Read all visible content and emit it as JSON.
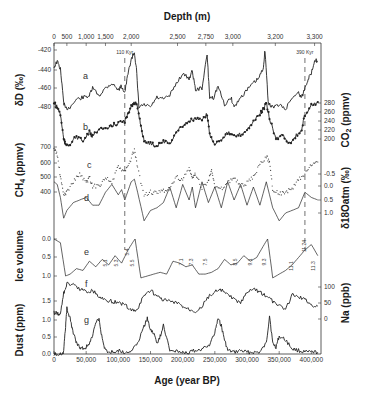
{
  "chart_data": {
    "type": "line",
    "title": "",
    "xlabel": "Age (year BP)",
    "x_top_label": "Depth (m)",
    "xlim": [
      0,
      415000
    ],
    "x_ticks": [
      0,
      50000,
      100000,
      150000,
      200000,
      250000,
      300000,
      350000,
      400000
    ],
    "x_tick_labels": [
      "0",
      "50,000",
      "100,000",
      "150,000",
      "200,000",
      "250,000",
      "300,000",
      "350,000",
      "400,000"
    ],
    "top_ticks": [
      {
        "label": "0",
        "age": 0
      },
      {
        "label": "500",
        "age": 20000
      },
      {
        "label": "1,000",
        "age": 50000
      },
      {
        "label": "1,500",
        "age": 80000
      },
      {
        "label": "2,000",
        "age": 120000
      },
      {
        "label": "2,500",
        "age": 192000
      },
      {
        "label": "2,750",
        "age": 236000
      },
      {
        "label": "3,000",
        "age": 278000
      },
      {
        "label": "3,200",
        "age": 344000
      },
      {
        "label": "3,300",
        "age": 405000
      }
    ],
    "markers": [
      {
        "label": "110 Kyr",
        "age": 110000
      },
      {
        "label": "390 Kyr",
        "age": 390000
      }
    ],
    "panels": [
      {
        "id": "a",
        "name": "δD",
        "axis_label": "δD (‰)",
        "side": "left",
        "ticks": [
          -420,
          -440,
          -460,
          -480
        ],
        "tick_px": [
          50,
          70,
          88,
          107
        ],
        "style": "line"
      },
      {
        "id": "b",
        "name": "CO2",
        "axis_label": "CO2 (ppmv)",
        "side": "right",
        "ticks": [
          280,
          260,
          240,
          220,
          200
        ],
        "tick_px": [
          103,
          112,
          121,
          130,
          139
        ],
        "style": "line-markers"
      },
      {
        "id": "c",
        "name": "CH4",
        "axis_label": "CH4 (ppmv)",
        "side": "left",
        "ticks": [
          700,
          600,
          500,
          400
        ],
        "tick_px": [
          147,
          163,
          177,
          192
        ],
        "style": "dotted"
      },
      {
        "id": "d",
        "name": "δ18Oatm",
        "axis_label": "δ18Oatm (‰)",
        "side": "right",
        "ticks": [
          -0.5,
          0.0,
          0.5,
          1.0
        ],
        "tick_px": [
          174,
          186,
          200,
          213
        ],
        "style": "line"
      },
      {
        "id": "e",
        "name": "Ice volume",
        "axis_label": "Ice volume",
        "side": "left",
        "ticks": [
          0.0,
          0.5,
          1.0
        ],
        "tick_px": [
          239,
          257,
          276
        ],
        "style": "line"
      },
      {
        "id": "f",
        "name": "Na",
        "axis_label": "Na (ppb)",
        "side": "right",
        "ticks": [
          100,
          50,
          0
        ],
        "tick_px": [
          287,
          303,
          319
        ],
        "style": "line"
      },
      {
        "id": "g",
        "name": "Dust",
        "axis_label": "Dust (ppm)",
        "side": "left",
        "ticks": [
          1.5,
          1.0,
          0.5,
          0.0
        ],
        "tick_px": [
          301,
          320,
          337,
          354
        ],
        "style": "line"
      }
    ],
    "mis_labels": [
      "5.1",
      "5.3",
      "5.4",
      "5.5",
      "7.1",
      "7.3",
      "7.5",
      "8.5",
      "9.1",
      "9.3",
      "11.1",
      "11.24",
      "11.3"
    ],
    "series": [
      {
        "name": "δD (a)",
        "x": [
          0,
          5000,
          10000,
          15000,
          18000,
          25000,
          35000,
          45000,
          55000,
          60000,
          70000,
          80000,
          90000,
          100000,
          105000,
          110000,
          115000,
          120000,
          125000,
          128000,
          132000,
          140000,
          150000,
          160000,
          170000,
          180000,
          190000,
          200000,
          210000,
          215000,
          220000,
          230000,
          238000,
          242000,
          248000,
          255000,
          265000,
          275000,
          280000,
          290000,
          300000,
          310000,
          318000,
          325000,
          328000,
          333000,
          340000,
          350000,
          360000,
          370000,
          380000,
          385000,
          390000,
          395000,
          400000,
          405000,
          410000
        ],
        "y": [
          -438,
          -432,
          -440,
          -475,
          -482,
          -480,
          -472,
          -470,
          -468,
          -460,
          -468,
          -460,
          -455,
          -462,
          -458,
          -465,
          -445,
          -430,
          -422,
          -440,
          -480,
          -478,
          -480,
          -470,
          -472,
          -468,
          -455,
          -445,
          -450,
          -442,
          -462,
          -460,
          -425,
          -470,
          -470,
          -458,
          -478,
          -470,
          -480,
          -470,
          -462,
          -455,
          -450,
          -440,
          -420,
          -476,
          -480,
          -478,
          -482,
          -470,
          -465,
          -470,
          -460,
          -450,
          -445,
          -430,
          -432
        ]
      },
      {
        "name": "CO2 (b)",
        "x": [
          0,
          5000,
          10000,
          15000,
          18000,
          25000,
          35000,
          45000,
          55000,
          60000,
          70000,
          80000,
          90000,
          100000,
          110000,
          115000,
          120000,
          125000,
          130000,
          135000,
          140000,
          150000,
          160000,
          170000,
          180000,
          190000,
          200000,
          210000,
          220000,
          230000,
          238000,
          242000,
          250000,
          260000,
          270000,
          280000,
          290000,
          300000,
          310000,
          320000,
          325000,
          330000,
          335000,
          345000,
          355000,
          365000,
          375000,
          385000,
          390000,
          400000,
          410000
        ],
        "y": [
          280,
          270,
          255,
          200,
          185,
          190,
          205,
          195,
          215,
          205,
          225,
          220,
          230,
          235,
          240,
          255,
          275,
          280,
          270,
          230,
          195,
          190,
          185,
          195,
          190,
          215,
          230,
          240,
          245,
          240,
          255,
          210,
          190,
          200,
          215,
          205,
          210,
          220,
          240,
          255,
          265,
          280,
          245,
          200,
          210,
          190,
          205,
          220,
          255,
          275,
          282
        ]
      },
      {
        "name": "CH4 (c)",
        "x": [
          0,
          5000,
          10000,
          15000,
          20000,
          30000,
          40000,
          50000,
          55000,
          60000,
          70000,
          80000,
          90000,
          100000,
          110000,
          118000,
          125000,
          130000,
          140000,
          150000,
          160000,
          170000,
          180000,
          190000,
          200000,
          210000,
          215000,
          220000,
          230000,
          240000,
          245000,
          250000,
          260000,
          270000,
          280000,
          290000,
          300000,
          310000,
          320000,
          330000,
          335000,
          340000,
          350000,
          360000,
          370000,
          380000,
          390000,
          400000,
          410000
        ],
        "y": [
          690,
          650,
          500,
          380,
          400,
          470,
          520,
          460,
          500,
          440,
          440,
          500,
          460,
          570,
          530,
          600,
          680,
          560,
          380,
          400,
          390,
          410,
          420,
          500,
          480,
          560,
          490,
          520,
          430,
          470,
          560,
          430,
          420,
          460,
          500,
          440,
          460,
          500,
          580,
          640,
          600,
          420,
          390,
          400,
          420,
          480,
          520,
          580,
          600
        ]
      },
      {
        "name": "δ18Oatm (d)",
        "x": [
          0,
          5000,
          10000,
          15000,
          20000,
          30000,
          40000,
          50000,
          60000,
          70000,
          80000,
          90000,
          100000,
          105000,
          110000,
          120000,
          125000,
          130000,
          140000,
          150000,
          160000,
          170000,
          180000,
          190000,
          200000,
          210000,
          215000,
          220000,
          230000,
          240000,
          250000,
          260000,
          270000,
          280000,
          290000,
          300000,
          310000,
          320000,
          330000,
          340000,
          350000,
          360000,
          370000,
          380000,
          390000,
          400000,
          410000
        ],
        "y": [
          -0.2,
          -0.1,
          0.4,
          1.2,
          0.9,
          0.6,
          0.5,
          0.4,
          0.7,
          0.7,
          0.2,
          -0.1,
          0.3,
          0.1,
          0.5,
          -0.2,
          -0.3,
          0.2,
          1.3,
          0.9,
          0.8,
          0.6,
          0.0,
          0.8,
          -0.1,
          0.5,
          0.0,
          0.8,
          -0.2,
          0.6,
          0.0,
          0.8,
          -0.2,
          0.5,
          -0.1,
          0.7,
          0.0,
          0.7,
          -0.2,
          0.8,
          1.3,
          1.0,
          0.9,
          0.8,
          0.2,
          0.4,
          0.5
        ]
      },
      {
        "name": "Ice volume (e)",
        "x": [
          0,
          10000,
          18000,
          25000,
          35000,
          45000,
          55000,
          65000,
          75000,
          85000,
          95000,
          105000,
          115000,
          122000,
          126000,
          135000,
          145000,
          155000,
          165000,
          175000,
          185000,
          195000,
          205000,
          215000,
          225000,
          235000,
          245000,
          255000,
          265000,
          275000,
          285000,
          295000,
          305000,
          315000,
          325000,
          332000,
          340000,
          350000,
          360000,
          370000,
          380000,
          390000,
          400000,
          410000
        ],
        "y": [
          0.0,
          0.1,
          1.0,
          0.95,
          0.8,
          0.85,
          0.6,
          0.75,
          0.55,
          0.7,
          0.45,
          0.65,
          0.3,
          0.1,
          0.0,
          1.05,
          1.0,
          0.95,
          0.9,
          0.95,
          0.6,
          0.65,
          0.75,
          0.7,
          0.95,
          0.95,
          0.9,
          0.8,
          0.55,
          0.7,
          0.65,
          0.45,
          0.6,
          0.5,
          0.2,
          0.0,
          1.05,
          0.95,
          0.85,
          0.7,
          0.5,
          0.3,
          0.15,
          0.45
        ]
      },
      {
        "name": "Na (f)",
        "x": [
          0,
          5000,
          10000,
          15000,
          20000,
          30000,
          40000,
          50000,
          60000,
          70000,
          80000,
          90000,
          100000,
          110000,
          118000,
          125000,
          130000,
          140000,
          150000,
          160000,
          170000,
          180000,
          190000,
          200000,
          210000,
          220000,
          230000,
          240000,
          250000,
          260000,
          270000,
          280000,
          290000,
          300000,
          310000,
          320000,
          330000,
          340000,
          350000,
          360000,
          370000,
          380000,
          390000,
          400000,
          410000
        ],
        "y": [
          20,
          18,
          15,
          80,
          110,
          105,
          95,
          85,
          90,
          70,
          60,
          55,
          50,
          45,
          30,
          25,
          30,
          75,
          90,
          70,
          60,
          55,
          50,
          40,
          30,
          25,
          40,
          70,
          85,
          90,
          75,
          60,
          50,
          80,
          95,
          85,
          70,
          55,
          40,
          30,
          75,
          70,
          60,
          45,
          40
        ]
      },
      {
        "name": "Dust (g)",
        "x": [
          0,
          10000,
          15000,
          18000,
          20000,
          25000,
          30000,
          35000,
          40000,
          45000,
          50000,
          55000,
          60000,
          65000,
          70000,
          75000,
          80000,
          90000,
          100000,
          110000,
          120000,
          130000,
          140000,
          145000,
          150000,
          155000,
          160000,
          165000,
          170000,
          180000,
          190000,
          200000,
          210000,
          220000,
          230000,
          240000,
          250000,
          255000,
          260000,
          265000,
          270000,
          280000,
          290000,
          300000,
          310000,
          320000,
          330000,
          335000,
          340000,
          345000,
          350000,
          360000,
          370000,
          380000,
          390000,
          400000,
          410000
        ],
        "y": [
          0.0,
          0.0,
          0.05,
          0.8,
          1.3,
          1.0,
          0.6,
          0.3,
          0.2,
          0.15,
          0.2,
          0.3,
          0.5,
          0.9,
          1.0,
          0.4,
          0.1,
          0.05,
          0.1,
          0.05,
          0.1,
          0.3,
          0.8,
          1.0,
          0.7,
          0.6,
          0.3,
          0.5,
          0.8,
          0.1,
          0.1,
          0.05,
          0.05,
          0.1,
          0.15,
          0.2,
          0.6,
          1.0,
          0.8,
          0.4,
          0.1,
          0.05,
          0.1,
          0.05,
          0.05,
          0.05,
          0.3,
          1.1,
          0.3,
          0.2,
          0.5,
          0.4,
          0.15,
          0.1,
          0.05,
          0.05,
          0.05
        ]
      }
    ]
  },
  "labels": {
    "top_axis_title": "Depth (m)",
    "bottom_axis_title": "Age (year BP)",
    "left": {
      "dD": "δD (‰)",
      "ch4": "CH",
      "ch4_sub": "4",
      "ch4_unit": " (ppmv)",
      "ice": "Ice volume",
      "dust": "Dust (ppm)"
    },
    "right": {
      "co2": "CO",
      "co2_sub": "2",
      "co2_unit": " (ppmv)",
      "d18o": "δ18Oatm (‰)",
      "na": "Na (ppb)"
    },
    "panel_letters": [
      "a",
      "b",
      "c",
      "d",
      "e",
      "f",
      "g"
    ],
    "marker_110": "110 Kyr",
    "marker_390": "390 Kyr"
  }
}
